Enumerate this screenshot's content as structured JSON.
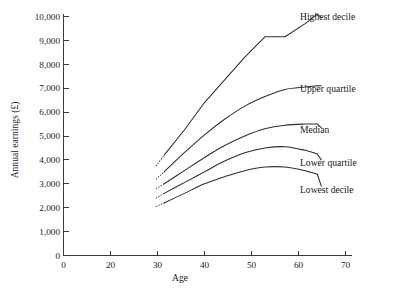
{
  "chart_data": {
    "type": "line",
    "title": "",
    "xlabel": "Age",
    "ylabel": "Annual earnings (£)",
    "xlim": [
      0,
      75
    ],
    "ylim": [
      0,
      10000
    ],
    "grid": false,
    "legend_position": "right-inline-labels",
    "xticks": [
      0,
      20,
      30,
      40,
      50,
      60,
      70
    ],
    "xtick_labels": [
      "0",
      "20",
      "30",
      "40",
      "50",
      "60",
      "70"
    ],
    "yticks": [
      0,
      1000,
      2000,
      3000,
      4000,
      5000,
      6000,
      7000,
      8000,
      9000,
      10000
    ],
    "ytick_labels": [
      "0",
      "1,000",
      "2,000",
      "3,000",
      "4,000",
      "5,000",
      "6,000",
      "7,000",
      "8,000",
      "9,000",
      "10,000"
    ],
    "x": [
      23,
      25,
      30,
      35,
      40,
      45,
      50,
      55,
      60,
      63
    ],
    "series": [
      {
        "name": "Highest decile",
        "label": "Highest decile",
        "values": [
          3750,
          4200,
          5250,
          6400,
          7350,
          8300,
          9150,
          9150,
          9700,
          10100
        ],
        "style": "solid-with-dotted-start",
        "dotted_start_x": [
          23,
          25
        ],
        "label_x": 64,
        "label_y": 9950
      },
      {
        "name": "Upper quartile",
        "label": "Upper quartile",
        "values": [
          3200,
          3500,
          4300,
          5050,
          5700,
          6250,
          6650,
          6950,
          7050,
          7100
        ],
        "style": "solid-with-dotted-start",
        "dotted_start_x": [
          23,
          25
        ],
        "label_x": 64,
        "label_y": 7100
      },
      {
        "name": "Median",
        "label": "Median",
        "values": [
          2800,
          3000,
          3550,
          4100,
          4600,
          5000,
          5300,
          5450,
          5500,
          5500
        ],
        "style": "solid-with-dotted-start",
        "dotted_start_x": [
          23,
          25
        ],
        "label_x": 64,
        "label_y": 5350
      },
      {
        "name": "Lower quartile",
        "label": "Lower quartile",
        "values": [
          2400,
          2600,
          3050,
          3500,
          3950,
          4300,
          4500,
          4550,
          4400,
          4250
        ],
        "style": "solid-with-dotted-start",
        "dotted_start_x": [
          23,
          25
        ],
        "label_x": 64,
        "label_y": 4000
      },
      {
        "name": "Lowest decile",
        "label": "Lowest decile",
        "values": [
          2050,
          2200,
          2600,
          3000,
          3300,
          3550,
          3700,
          3700,
          3550,
          3400
        ],
        "style": "solid-with-dotted-start",
        "dotted_start_x": [
          23,
          25
        ],
        "label_x": 64,
        "label_y": 2900
      }
    ]
  },
  "caption": {
    "text": ""
  }
}
